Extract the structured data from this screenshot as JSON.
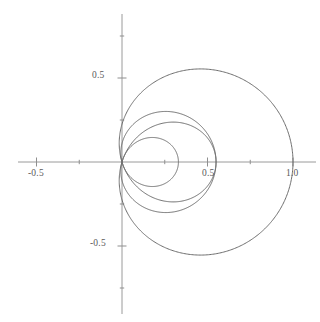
{
  "figure": {
    "title": "",
    "background_color": "#ffffff",
    "width": 320,
    "height": 322
  },
  "axes": {
    "origin_px": {
      "x": 122,
      "y": 162
    },
    "unit_px": {
      "x": 171,
      "y": 168
    },
    "axis_color": "#9a9a9a",
    "tick_color": "#8f8f8f",
    "label_color": "#5a5a5a",
    "x_label_text": "",
    "y_label_text": "",
    "x_tick_labels": [
      "-0.5",
      "0.5",
      "1.0"
    ],
    "y_tick_labels": [
      "0.5",
      "-0.5"
    ],
    "x_major_ticks": [
      -0.5,
      0.5,
      1.0
    ],
    "y_major_ticks": [
      0.5,
      -0.5
    ],
    "x_minor_ticks": [
      -0.25,
      0.25,
      0.75
    ],
    "y_minor_ticks": [
      0.75,
      0.25,
      -0.25,
      -0.75
    ],
    "grid": false
  },
  "labels": {
    "x_neg_half": "-0.5",
    "x_half": "0.5",
    "x_one": "1.0",
    "y_half": "0.5",
    "y_neg_half": "-0.5"
  },
  "chart_data": {
    "type": "line",
    "title": "",
    "xlabel": "",
    "ylabel": "",
    "xlim": [
      -0.62,
      1.02
    ],
    "ylim": [
      -0.85,
      0.85
    ],
    "grid": false,
    "legend": "none",
    "curve_color": "#6e6e6e",
    "series": [
      {
        "name": "outer-curve",
        "polar_form": "r = a + b*cos(theta)",
        "a": 0.225,
        "b": 0.775,
        "color": "#6e6e6e",
        "linewidth": 1,
        "x_max": 1.0,
        "x_min": -0.55,
        "y_max": 0.845,
        "y_min": -0.845,
        "x_axis_crossings": [
          1.0,
          -0.55
        ],
        "y_axis_crossings": [
          0.845,
          -0.845
        ]
      },
      {
        "name": "inner-curve",
        "polar_form": "r = a + b*cos(theta)",
        "a": -0.11,
        "b": 0.44,
        "color": "#6e6e6e",
        "linewidth": 1,
        "x_max": 0.33,
        "x_min": -0.55,
        "y_max": 0.41,
        "y_min": -0.41,
        "x_axis_crossings": [
          0.33,
          -0.55
        ],
        "y_axis_crossings": [
          0.41,
          -0.41
        ]
      }
    ],
    "intersection_points": [
      {
        "x": -0.55,
        "y": 0.0
      }
    ]
  }
}
